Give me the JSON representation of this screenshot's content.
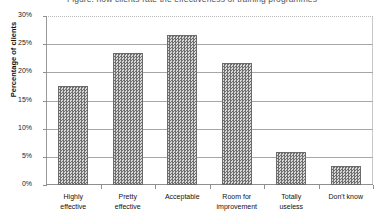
{
  "chart_data": {
    "type": "bar",
    "title": "Figure: how clients rate the effectiveness of training programmes",
    "xlabel": "",
    "ylabel": "Percentage of clients",
    "ylim": [
      0,
      30
    ],
    "ytick_labels": [
      "30%",
      "25%",
      "20%",
      "15%",
      "10%",
      "5%",
      "0%"
    ],
    "ytick_values": [
      30,
      25,
      20,
      15,
      10,
      5,
      0
    ],
    "grid": true,
    "legend": "none",
    "categories": [
      "Highly effective",
      "Pretty effective",
      "Acceptable",
      "Room for improvement",
      "Totally useless",
      "Don't know"
    ],
    "category_lines": [
      [
        "Highly",
        "effective"
      ],
      [
        "Pretty",
        "effective"
      ],
      [
        "Acceptable",
        ""
      ],
      [
        "Room for",
        "improvement"
      ],
      [
        "Totally",
        "useless"
      ],
      [
        "Don't know",
        ""
      ]
    ],
    "values": [
      17.6,
      23.4,
      26.7,
      21.6,
      5.8,
      3.4
    ],
    "bar_fill": "#a8a8a8",
    "bar_border": "#6b6b6b",
    "grid_color": "#a7a7a7"
  }
}
